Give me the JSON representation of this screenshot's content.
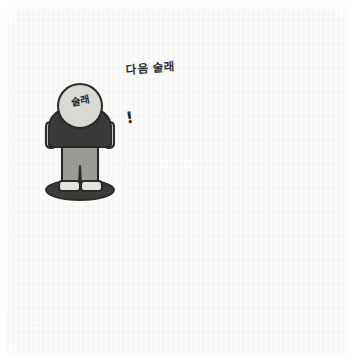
{
  "scene": {
    "title": "Korean tag game illustration",
    "background_color": "#f4f4f2",
    "frame_color": "#ffffff",
    "outline_color": "#2b2b2b"
  },
  "palette": {
    "skin_light": "#d9dad4",
    "head_dark": "#2c2c32",
    "shirt_grey": "#8d8f8c",
    "shirt_black": "#3a3a3a",
    "pants_grey": "#9a9b97",
    "shoe_light": "#e3e4df",
    "shadow": "#53544f",
    "shadow_dark": "#3c3d39",
    "ink": "#2b2b2b"
  },
  "annotations": {
    "caption_text": "다음 술래",
    "caption_arrow": "down-arrow",
    "exclamation": "!",
    "motion_lines": "speed-lines",
    "tagger_label": "술래"
  },
  "figures": [
    {
      "id": "tagger-standing",
      "label": "술래",
      "pose": "standing-front",
      "head": "light",
      "shirt": "black",
      "role": "current-tagger",
      "x": 48,
      "y": 84
    },
    {
      "id": "next-tagger-running",
      "label": "다음 술래",
      "pose": "running-left",
      "head": "dark",
      "shirt": "grey",
      "role": "next-tagger",
      "x": 118,
      "y": 108
    },
    {
      "id": "runner-top-right",
      "label": "",
      "pose": "running-right",
      "head": "dark",
      "shirt": "grey",
      "role": "player",
      "x": 236,
      "y": 38
    },
    {
      "id": "standing-upper-middle",
      "label": "",
      "pose": "standing-back",
      "head": "light",
      "shirt": "grey",
      "role": "player",
      "x": 172,
      "y": 78
    },
    {
      "id": "standing-center",
      "label": "",
      "pose": "standing-back",
      "head": "light",
      "shirt": "grey",
      "role": "player",
      "x": 190,
      "y": 162
    },
    {
      "id": "standing-left-lower",
      "label": "",
      "pose": "standing-front",
      "head": "light",
      "shirt": "grey",
      "role": "player",
      "x": 52,
      "y": 208
    },
    {
      "id": "standing-bottom-left",
      "label": "",
      "pose": "standing-front",
      "head": "light",
      "shirt": "grey",
      "role": "player",
      "x": 102,
      "y": 252
    },
    {
      "id": "running-bottom-center",
      "label": "",
      "pose": "running-away",
      "head": "light",
      "shirt": "grey",
      "role": "player",
      "x": 182,
      "y": 250
    },
    {
      "id": "running-bottom-right",
      "label": "",
      "pose": "leaping-right",
      "head": "light",
      "shirt": "grey",
      "role": "player",
      "x": 252,
      "y": 190
    }
  ]
}
